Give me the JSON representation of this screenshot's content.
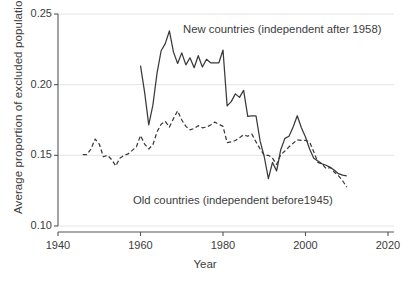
{
  "chart_data": {
    "type": "line",
    "title": "",
    "xlabel": "Year",
    "ylabel": "Average proportion of excluded population",
    "xlim": [
      1940,
      2020
    ],
    "ylim": [
      0.1,
      0.25
    ],
    "xticks": [
      1940,
      1960,
      1980,
      2000,
      2020
    ],
    "yticks": [
      0.1,
      0.15,
      0.2,
      0.25
    ],
    "xtick_labels": [
      "1940",
      "1960",
      "1980",
      "2000",
      "2020"
    ],
    "ytick_labels": [
      "0.10",
      "0.15",
      "0.20",
      "0.25"
    ],
    "grid": "horizontal-gridlines-light",
    "legend": "inline-annotations",
    "line_color": "#3a3a3a",
    "gridline_color": "#e4e4e4",
    "axis_color": "#555555",
    "series": [
      {
        "name": "New countries (independent after 1958)",
        "style": "solid",
        "annotation_position": "upper-right",
        "x": [
          1960,
          1961,
          1962,
          1963,
          1964,
          1965,
          1966,
          1967,
          1968,
          1969,
          1970,
          1971,
          1972,
          1973,
          1974,
          1975,
          1976,
          1977,
          1978,
          1979,
          1980,
          1981,
          1982,
          1983,
          1984,
          1985,
          1986,
          1987,
          1988,
          1989,
          1990,
          1991,
          1992,
          1993,
          1994,
          1995,
          1996,
          1997,
          1998,
          1999,
          2000,
          2001,
          2002,
          2003,
          2004,
          2005,
          2006,
          2007,
          2008,
          2009,
          2010
        ],
        "y": [
          0.2135,
          0.1945,
          0.1715,
          0.1855,
          0.208,
          0.224,
          0.229,
          0.238,
          0.223,
          0.215,
          0.2225,
          0.214,
          0.219,
          0.212,
          0.2205,
          0.2125,
          0.218,
          0.2155,
          0.2155,
          0.2155,
          0.2245,
          0.185,
          0.188,
          0.1935,
          0.191,
          0.196,
          0.1775,
          0.178,
          0.178,
          0.16,
          0.149,
          0.1335,
          0.145,
          0.139,
          0.154,
          0.162,
          0.1635,
          0.17,
          0.178,
          0.1695,
          0.163,
          0.1545,
          0.148,
          0.146,
          0.144,
          0.143,
          0.1415,
          0.1395,
          0.137,
          0.136,
          0.1355
        ]
      },
      {
        "name": "Old countries (independent before1945)",
        "style": "dashed",
        "annotation_position": "lower-center",
        "x": [
          1946,
          1947,
          1948,
          1949,
          1950,
          1951,
          1952,
          1953,
          1954,
          1955,
          1956,
          1957,
          1958,
          1959,
          1960,
          1961,
          1962,
          1963,
          1964,
          1965,
          1966,
          1967,
          1968,
          1969,
          1970,
          1971,
          1972,
          1973,
          1974,
          1975,
          1976,
          1977,
          1978,
          1979,
          1980,
          1981,
          1982,
          1983,
          1984,
          1985,
          1986,
          1987,
          1988,
          1989,
          1990,
          1991,
          1992,
          1993,
          1994,
          1995,
          1996,
          1997,
          1998,
          1999,
          2000,
          2001,
          2002,
          2003,
          2004,
          2005,
          2006,
          2007,
          2008,
          2009,
          2010
        ],
        "y": [
          0.1505,
          0.1505,
          0.1545,
          0.1615,
          0.158,
          0.149,
          0.15,
          0.147,
          0.1425,
          0.148,
          0.15,
          0.151,
          0.1535,
          0.156,
          0.164,
          0.158,
          0.1545,
          0.1575,
          0.1665,
          0.172,
          0.174,
          0.17,
          0.176,
          0.1815,
          0.175,
          0.1705,
          0.168,
          0.169,
          0.171,
          0.1695,
          0.17,
          0.1715,
          0.1735,
          0.172,
          0.1705,
          0.159,
          0.1595,
          0.1605,
          0.1625,
          0.1645,
          0.1635,
          0.165,
          0.1595,
          0.1545,
          0.15,
          0.15,
          0.148,
          0.1435,
          0.1505,
          0.153,
          0.156,
          0.1585,
          0.161,
          0.1605,
          0.1605,
          0.1595,
          0.1525,
          0.145,
          0.144,
          0.1405,
          0.1415,
          0.138,
          0.1355,
          0.132,
          0.1275
        ]
      }
    ],
    "annotations": [
      {
        "text": "New countries (independent after 1958)",
        "series": "new"
      },
      {
        "text": "Old countries (independent before1945)",
        "series": "old"
      }
    ]
  }
}
